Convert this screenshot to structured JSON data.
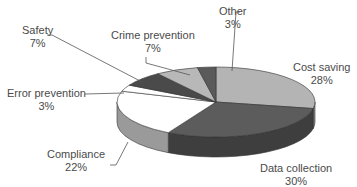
{
  "chart_data": {
    "type": "pie",
    "style": "3d",
    "title": "",
    "categories": [
      "Cost saving",
      "Data collection",
      "Compliance",
      "Error prevention",
      "Safety",
      "Crime prevention",
      "Other"
    ],
    "values": [
      28,
      30,
      22,
      3,
      7,
      7,
      3
    ],
    "unit": "%",
    "labels": [
      {
        "name": "Cost saving",
        "pct": "28%"
      },
      {
        "name": "Data collection",
        "pct": "30%"
      },
      {
        "name": "Compliance",
        "pct": "22%"
      },
      {
        "name": "Error prevention",
        "pct": "3%"
      },
      {
        "name": "Safety",
        "pct": "7%"
      },
      {
        "name": "Crime prevention",
        "pct": "7%"
      },
      {
        "name": "Other",
        "pct": "3%"
      }
    ],
    "colors": [
      "#b4b4b4",
      "#5c5c5c",
      "#ffffff",
      "#ffffff",
      "#4a4a4a",
      "#b8b8b8",
      "#5a5a5a"
    ],
    "side_colors": [
      "#8c8c8c",
      "#3e3e3e",
      "#9a9a9a",
      "#9a9a9a",
      "#333333",
      "#8c8c8c",
      "#3e3e3e"
    ],
    "legend": "none (callout labels)"
  }
}
